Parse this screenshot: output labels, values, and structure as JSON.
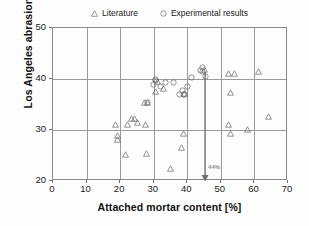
{
  "chart_data": {
    "type": "scatter",
    "title": "",
    "xlabel": "Attached mortar content [%]",
    "ylabel": "Los Angeles abrasion",
    "xlim": [
      0,
      70
    ],
    "ylim": [
      20,
      50
    ],
    "xticks": [
      0,
      10,
      20,
      30,
      40,
      50,
      60,
      70
    ],
    "yticks": [
      20,
      30,
      40,
      50
    ],
    "grid": true,
    "legend_position": "top-center",
    "series": [
      {
        "name": "Literature",
        "marker": "triangle",
        "points": [
          [
            18.7,
            31.1
          ],
          [
            19.2,
            29.0
          ],
          [
            19.2,
            28.1
          ],
          [
            21.5,
            25.1
          ],
          [
            22.2,
            31.1
          ],
          [
            23.5,
            32.3
          ],
          [
            24.3,
            32.2
          ],
          [
            25.2,
            31.4
          ],
          [
            27.7,
            31.1
          ],
          [
            27.4,
            35.3
          ],
          [
            27.9,
            25.3
          ],
          [
            28.2,
            35.3
          ],
          [
            30.5,
            37.6
          ],
          [
            31.0,
            39.5
          ],
          [
            33.0,
            38.2
          ],
          [
            35.0,
            22.4
          ],
          [
            38.4,
            26.6
          ],
          [
            38.8,
            29.4
          ],
          [
            39.2,
            37.1
          ],
          [
            45.0,
            41.8
          ],
          [
            52.2,
            41.0
          ],
          [
            53.0,
            29.4
          ],
          [
            52.4,
            31.1
          ],
          [
            53.0,
            37.4
          ],
          [
            54.0,
            41.0
          ],
          [
            58.0,
            30.1
          ],
          [
            61.2,
            41.5
          ],
          [
            64.2,
            32.6
          ]
        ]
      },
      {
        "name": "Experimental results",
        "marker": "circle",
        "points": [
          [
            28.2,
            35.4
          ],
          [
            30.0,
            38.9
          ],
          [
            30.4,
            39.7
          ],
          [
            30.5,
            39.9
          ],
          [
            32.0,
            38.6
          ],
          [
            33.5,
            39.4
          ],
          [
            35.8,
            39.3
          ],
          [
            37.6,
            36.9
          ],
          [
            38.6,
            37.8
          ],
          [
            39.0,
            37.0
          ],
          [
            39.3,
            37.0
          ],
          [
            40.0,
            38.5
          ],
          [
            41.2,
            40.2
          ],
          [
            43.8,
            41.6
          ],
          [
            44.5,
            42.2
          ],
          [
            44.6,
            41.4
          ],
          [
            45.3,
            40.4
          ]
        ]
      }
    ],
    "annotations": [
      {
        "type": "arrow",
        "label": "44%",
        "x": 45.3,
        "y_from": 41.4,
        "y_to": 20.0
      }
    ]
  },
  "legend": {
    "entries": [
      {
        "label": "Literature",
        "marker": "triangle-marker"
      },
      {
        "label": "Experimental results",
        "marker": "circle-marker"
      }
    ]
  },
  "axes": {
    "x_title": "Attached mortar content [%]",
    "y_title": "Los Angeles abrasion",
    "x_tick_labels": [
      "0",
      "10",
      "20",
      "30",
      "40",
      "50",
      "60",
      "70"
    ],
    "y_tick_labels": [
      "20",
      "30",
      "40",
      "50"
    ]
  },
  "colors": {
    "marker_stroke": "#707070",
    "grid": "#9b9b9b",
    "frame": "#8a8a8a",
    "annotation": "#8d8d8d",
    "text": "#1a1a1a",
    "background": "#ffffff"
  }
}
